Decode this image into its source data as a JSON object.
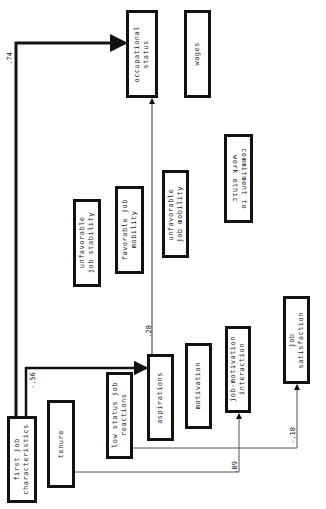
{
  "diagram": {
    "nodes": [
      {
        "id": "first_job",
        "label": "first job\ncharacteristics"
      },
      {
        "id": "tenure",
        "label": "tenure"
      },
      {
        "id": "low_status",
        "label": "low status job\nreactions"
      },
      {
        "id": "aspirations",
        "label": "aspirations"
      },
      {
        "id": "motivation",
        "label": "motivation"
      },
      {
        "id": "job_motivation",
        "label": "job-motivation\ninteraction"
      },
      {
        "id": "job_satisfaction",
        "label": "job\nsatisfaction"
      },
      {
        "id": "unfav_stability",
        "label": "unfavorable\njob stability"
      },
      {
        "id": "fav_mobility",
        "label": "favorable job\nmobility"
      },
      {
        "id": "unfav_mobility",
        "label": "unfavorable\njob mobility"
      },
      {
        "id": "commitment",
        "label": "commitment to\nwork ethic"
      },
      {
        "id": "occupational_status",
        "label": "occupational\nstatus"
      },
      {
        "id": "wages",
        "label": "wages"
      }
    ],
    "edges": [
      {
        "from": "first_job",
        "to": "occupational_status",
        "coef": ".74"
      },
      {
        "from": "first_job",
        "to": "aspirations",
        "coef": "-.56"
      },
      {
        "from": "aspirations",
        "to": "occupational_status",
        "coef": ".28"
      },
      {
        "from": "tenure",
        "to": "job_motivation",
        "coef": ".09"
      },
      {
        "from": "low_status",
        "to": "job_satisfaction",
        "coef": "-.18"
      }
    ]
  }
}
